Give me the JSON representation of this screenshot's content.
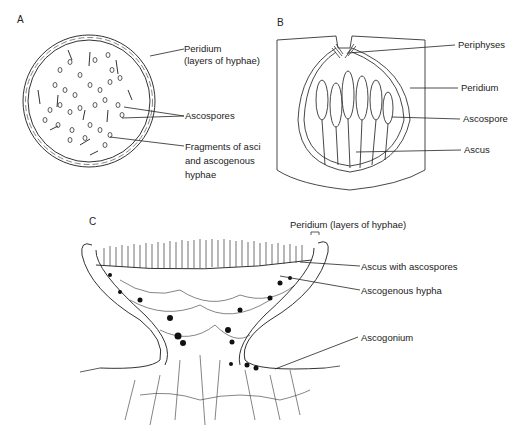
{
  "figure": {
    "panels": [
      {
        "id": "A",
        "letter": "A",
        "labels": {
          "peridium_1": "Peridium",
          "peridium_2": "(layers of hyphae)",
          "ascospores": "Ascospores",
          "fragments_1": "Fragments of asci",
          "fragments_2": "and ascogenous",
          "fragments_3": "hyphae"
        }
      },
      {
        "id": "B",
        "letter": "B",
        "labels": {
          "periphyses": "Periphyses",
          "peridium": "Peridium",
          "ascospore": "Ascospore",
          "ascus": "Ascus"
        }
      },
      {
        "id": "C",
        "letter": "C",
        "labels": {
          "peridium": "Peridium (layers of hyphae)",
          "ascus_with_ascospores": "Ascus with ascospores",
          "ascogenous_hypha": "Ascogenous hypha",
          "ascogonium": "Ascogonium"
        }
      }
    ]
  }
}
